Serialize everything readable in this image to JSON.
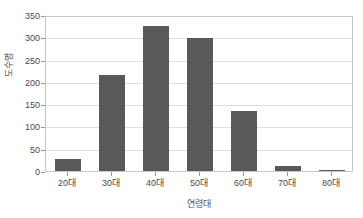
{
  "chart_data": {
    "type": "bar",
    "title": "",
    "subtitle": "",
    "xlabel": "연령대",
    "ylabel": "도수명",
    "categories": [
      "20대",
      "30대",
      "40대",
      "50대",
      "60대",
      "70대",
      "80대"
    ],
    "values": [
      26,
      216,
      325,
      298,
      135,
      12,
      3
    ],
    "series": [
      {
        "name": "도수",
        "values": [
          26,
          216,
          325,
          298,
          135,
          12,
          3
        ]
      }
    ],
    "ylim": [
      0,
      350
    ],
    "yticks": [
      0,
      50,
      100,
      150,
      200,
      250,
      300,
      350
    ],
    "ytick_labels": [
      "0",
      "50",
      "100",
      "150",
      "200",
      "250",
      "300",
      "350"
    ],
    "grid": true,
    "grid_axis": "y",
    "legend": false,
    "legend_position": "none",
    "bar_color": "#595959",
    "plot_border_color": "#c8c8c8",
    "gridline_color": "#dedede",
    "background_color": "#ffffff",
    "text_color": "#4a4a4a"
  }
}
